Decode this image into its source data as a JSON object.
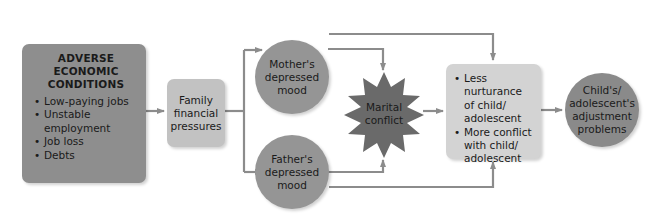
{
  "diagram": {
    "type": "flow-diagram",
    "nodes": {
      "adverse": {
        "title_lines": [
          "ADVERSE",
          "ECONOMIC",
          "CONDITIONS"
        ],
        "bullets": [
          "Low-paying jobs",
          "Unstable employment",
          "Job loss",
          "Debts"
        ]
      },
      "family": {
        "lines": [
          "Family",
          "financial",
          "pressures"
        ]
      },
      "mother": {
        "lines": [
          "Mother's",
          "depressed",
          "mood"
        ]
      },
      "father": {
        "lines": [
          "Father's",
          "depressed",
          "mood"
        ]
      },
      "marital": {
        "lines": [
          "Marital",
          "conflict"
        ]
      },
      "parenting": {
        "bullets": [
          "Less nurturance of child/ adolescent",
          "More conflict with child/ adolescent"
        ]
      },
      "child": {
        "lines": [
          "Child's/",
          "adolescent's",
          "adjustment",
          "problems"
        ]
      }
    },
    "edges": [
      [
        "adverse",
        "family"
      ],
      [
        "family",
        "mother"
      ],
      [
        "family",
        "father"
      ],
      [
        "mother",
        "marital"
      ],
      [
        "father",
        "marital"
      ],
      [
        "mother",
        "parenting"
      ],
      [
        "father",
        "parenting"
      ],
      [
        "marital",
        "parenting"
      ],
      [
        "parenting",
        "child"
      ]
    ],
    "colors": {
      "adverse_fill": "#8e8e8e",
      "family_fill": "#c2c2c2",
      "circle_fill": "#959595",
      "star_fill": "#6a6a6a",
      "parenting_fill": "#d3d3d3",
      "child_fill": "#8a8a8a",
      "arrow": "#8c8c8c"
    }
  }
}
